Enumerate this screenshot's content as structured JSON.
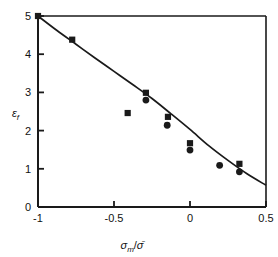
{
  "chart_data": {
    "type": "scatter",
    "title": "",
    "subtitle": "",
    "xlabel": "σm/σ̄",
    "ylabel": "εf",
    "xlim": [
      -1,
      0.5
    ],
    "ylim": [
      0,
      5
    ],
    "grid": false,
    "legend": "none",
    "xticks": [
      -1,
      -0.5,
      0,
      0.5
    ],
    "xtick_labels": [
      "-1",
      "-0.5",
      "0",
      "0.5"
    ],
    "yticks": [
      0,
      1,
      2,
      3,
      4,
      5
    ],
    "ytick_labels": [
      "0",
      "1",
      "2",
      "3",
      "4",
      "5"
    ],
    "series": [
      {
        "name": "squares",
        "marker": "square",
        "color": "#1a1a1a",
        "points": [
          {
            "x": -1.0,
            "y": 5.0
          },
          {
            "x": -0.775,
            "y": 4.38
          },
          {
            "x": -0.41,
            "y": 2.46
          },
          {
            "x": -0.29,
            "y": 2.99
          },
          {
            "x": -0.145,
            "y": 2.36
          },
          {
            "x": 0.0,
            "y": 1.67
          },
          {
            "x": 0.325,
            "y": 1.13
          }
        ]
      },
      {
        "name": "circles",
        "marker": "circle",
        "color": "#1a1a1a",
        "points": [
          {
            "x": -0.29,
            "y": 2.8
          },
          {
            "x": -0.15,
            "y": 2.14
          },
          {
            "x": 0.0,
            "y": 1.49
          },
          {
            "x": 0.195,
            "y": 1.09
          },
          {
            "x": 0.325,
            "y": 0.92
          }
        ]
      },
      {
        "name": "fit-curve",
        "marker": "none",
        "color": "#1a1a1a",
        "points": [
          {
            "x": -1.0,
            "y": 5.0
          },
          {
            "x": -0.875,
            "y": 4.62
          },
          {
            "x": -0.75,
            "y": 4.26
          },
          {
            "x": -0.625,
            "y": 3.9
          },
          {
            "x": -0.5,
            "y": 3.55
          },
          {
            "x": -0.375,
            "y": 3.2
          },
          {
            "x": -0.25,
            "y": 2.84
          },
          {
            "x": -0.125,
            "y": 2.44
          },
          {
            "x": 0.0,
            "y": 2.03
          },
          {
            "x": 0.125,
            "y": 1.6
          },
          {
            "x": 0.25,
            "y": 1.22
          },
          {
            "x": 0.375,
            "y": 0.87
          },
          {
            "x": 0.5,
            "y": 0.57
          }
        ]
      }
    ]
  },
  "axis_label_parts": {
    "x_sigma": "σ",
    "x_sub": "m",
    "x_slash": "/",
    "x_sigma_bar": "σ̄",
    "y_epsilon": "ε",
    "y_sub": "f"
  }
}
